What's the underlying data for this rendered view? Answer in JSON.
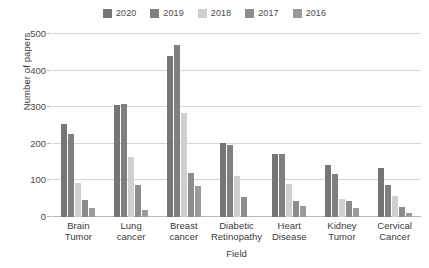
{
  "chart_data": {
    "type": "bar",
    "title": "",
    "subtitle": "",
    "xlabel": "Field",
    "ylabel": "Number of papers",
    "ylim": [
      0,
      500
    ],
    "yticks": [
      0,
      100,
      200,
      300,
      400,
      500
    ],
    "ytick_labels": [
      "0",
      "100",
      "200",
      "300",
      "400",
      "500"
    ],
    "grid": true,
    "legend_position": "top-center",
    "categories": [
      "Brain Tumor",
      "Lung cancer",
      "Breast cancer",
      "Diabetic Retinopathy",
      "Heart Disease",
      "Kidney Tumor",
      "Cervical Cancer"
    ],
    "category_lines": [
      [
        "Brain",
        "Tumor"
      ],
      [
        "Lung",
        "cancer"
      ],
      [
        "Breast",
        "cancer"
      ],
      [
        "Diabetic",
        "Retinopathy"
      ],
      [
        "Heart",
        "Disease"
      ],
      [
        "Kidney",
        "Tumor"
      ],
      [
        "Cervical",
        "Cancer"
      ]
    ],
    "series": [
      {
        "name": "2020",
        "color": "#757575",
        "values": [
          255,
          307,
          440,
          201,
          173,
          143,
          135
        ]
      },
      {
        "name": "2019",
        "color": "#7f7f7f",
        "values": [
          228,
          309,
          470,
          197,
          171,
          117,
          87
        ]
      },
      {
        "name": "2018",
        "color": "#cfcfcf",
        "values": [
          93,
          165,
          283,
          112,
          91,
          49,
          57
        ]
      },
      {
        "name": "2017",
        "color": "#8c8c8c",
        "values": [
          46,
          88,
          121,
          56,
          43,
          43,
          26
        ]
      },
      {
        "name": "2016",
        "color": "#9a9a9a",
        "values": [
          24,
          20,
          85,
          0,
          29,
          25,
          11
        ]
      }
    ]
  },
  "colors": {
    "background": "#ffffff",
    "grid": "#d6d6d6",
    "axis": "#b9b9b9",
    "text": "#3a3a3a"
  }
}
